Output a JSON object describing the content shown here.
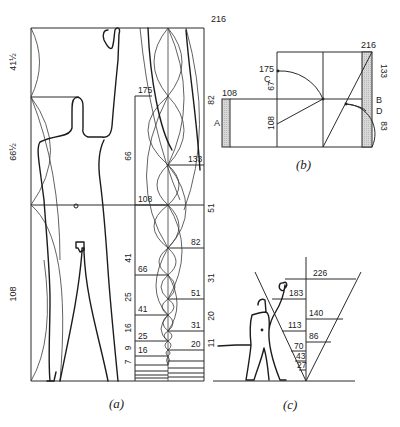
{
  "figure": {
    "panels": [
      {
        "id": "a",
        "caption": "(a)"
      },
      {
        "id": "b",
        "caption": "(b)"
      },
      {
        "id": "c",
        "caption": "(c)"
      }
    ]
  },
  "panel_a": {
    "caption": "(a)",
    "left_scale": {
      "segments": [
        {
          "label": "41½"
        },
        {
          "label": "66½"
        },
        {
          "label": "108"
        }
      ]
    },
    "top_value": "216",
    "inner_left_labels": {
      "heights": [
        "175",
        "108",
        "66",
        "41",
        "25",
        "16"
      ],
      "intervals": [
        "66",
        "41",
        "25",
        "16",
        "9",
        "7"
      ]
    },
    "inner_right_labels": {
      "heights": [
        "133",
        "82",
        "51",
        "31",
        "20"
      ],
      "intervals": [
        "82",
        "51",
        "31",
        "20",
        "11"
      ]
    }
  },
  "panel_b": {
    "caption": "(b)",
    "top_right": "216",
    "left_box_top": "108",
    "label_A": "A",
    "label_B": "B",
    "label_C": "C",
    "label_D": "D",
    "point_175": "175",
    "seg_67": "67",
    "point_108": "108",
    "seg_133": "133",
    "seg_83": "83"
  },
  "panel_c": {
    "caption": "(c)",
    "left_values": [
      "183",
      "113",
      "70",
      "43",
      "27"
    ],
    "right_values": [
      "226",
      "140",
      "86"
    ]
  }
}
